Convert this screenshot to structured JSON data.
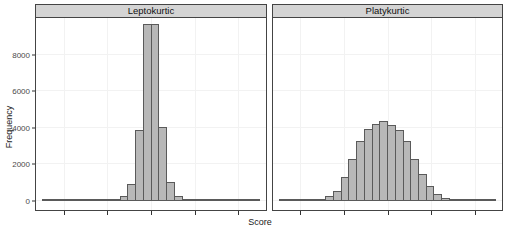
{
  "figure": {
    "xlabel": "Score",
    "ylabel": "Frequency"
  },
  "panels": [
    {
      "title": "Leptokurtic"
    },
    {
      "title": "Platykurtic"
    }
  ],
  "y_axis": {
    "tick_labels": [
      "8000",
      "6000",
      "4000",
      "2000",
      "0"
    ],
    "tick_values": [
      8000,
      6000,
      4000,
      2000,
      0
    ]
  },
  "x_axis": {
    "tick_labels": [],
    "ticks_per_panel": 5
  },
  "colors": {
    "bar_fill": "#b8b8b8",
    "bar_border": "#5a5a5a",
    "strip_bg": "#d4d4d4",
    "panel_border": "#444444",
    "grid": "#f2f2f2"
  },
  "chart_data": [
    {
      "type": "bar",
      "subtype": "histogram",
      "title": "Leptokurtic",
      "xlabel": "Score",
      "ylabel": "Frequency",
      "ylim": [
        0,
        10000
      ],
      "y_ticks": [
        0,
        2000,
        4000,
        6000,
        8000
      ],
      "bins": 28,
      "x_tick_marks_labeled": false,
      "grid": "faint major gridlines",
      "legend": "none",
      "values": [
        7,
        8,
        9,
        10,
        12,
        15,
        20,
        30,
        45,
        90,
        250,
        950,
        3900,
        9650,
        9650,
        4050,
        1050,
        250,
        90,
        45,
        30,
        20,
        15,
        12,
        10,
        8,
        7,
        6
      ]
    },
    {
      "type": "bar",
      "subtype": "histogram",
      "title": "Platykurtic",
      "xlabel": "Score",
      "ylabel": "Frequency",
      "ylim": [
        0,
        10000
      ],
      "y_ticks": [
        0,
        2000,
        4000,
        6000,
        8000
      ],
      "bins": 28,
      "x_tick_marks_labeled": false,
      "grid": "faint major gridlines",
      "legend": "none",
      "values": [
        5,
        8,
        15,
        30,
        60,
        130,
        270,
        550,
        1300,
        2280,
        3280,
        3950,
        4190,
        4370,
        4150,
        3900,
        3280,
        2280,
        1460,
        800,
        400,
        180,
        80,
        40,
        20,
        10,
        6,
        5
      ]
    }
  ]
}
